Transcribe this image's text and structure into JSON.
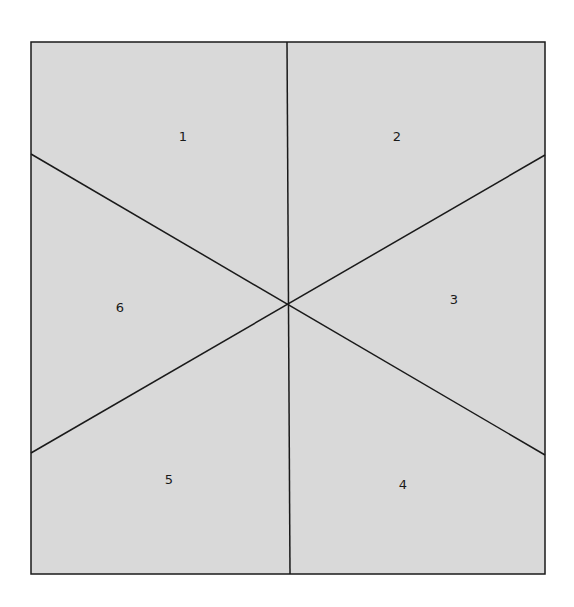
{
  "diagram": {
    "type": "square divided into six regions by three lines through a central point",
    "colors": {
      "fill": "#d9d9d9",
      "stroke": "#1a1a1a",
      "background": "#ffffff"
    },
    "square": {
      "x1": 31,
      "y1": 42,
      "x2": 545,
      "y2": 574
    },
    "center": {
      "x": 288,
      "y": 305
    },
    "lines": [
      {
        "name": "vertical",
        "from": [
          287,
          42
        ],
        "to": [
          290,
          574
        ]
      },
      {
        "name": "diagonal-down",
        "from": [
          31,
          154
        ],
        "to": [
          545,
          455
        ]
      },
      {
        "name": "diagonal-up",
        "from": [
          31,
          453
        ],
        "to": [
          545,
          155
        ]
      }
    ],
    "regions": [
      {
        "label": "1",
        "x": 183,
        "y": 136
      },
      {
        "label": "2",
        "x": 397,
        "y": 136
      },
      {
        "label": "3",
        "x": 454,
        "y": 299
      },
      {
        "label": "4",
        "x": 403,
        "y": 484
      },
      {
        "label": "5",
        "x": 169,
        "y": 479
      },
      {
        "label": "6",
        "x": 120,
        "y": 307
      }
    ]
  }
}
